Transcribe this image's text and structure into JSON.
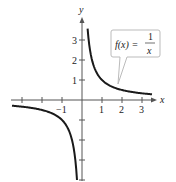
{
  "chart_data": {
    "type": "line",
    "title": "",
    "function_label": {
      "lhs": "f(x) =",
      "num": "1",
      "den": "x"
    },
    "xlabel": "x",
    "ylabel": "y",
    "xlim": [
      -3.5,
      3.5
    ],
    "ylim": [
      -4,
      3.6
    ],
    "x_ticks": [
      -3,
      -2,
      -1,
      1,
      2,
      3
    ],
    "x_tick_labels": [
      "",
      "",
      "-1",
      "1",
      "2",
      "3"
    ],
    "y_ticks": [
      -4,
      -3,
      -2,
      -1,
      1,
      2,
      3
    ],
    "y_tick_labels": [
      "",
      "",
      "",
      "",
      "1",
      "2",
      "3"
    ],
    "grid": false,
    "series": [
      {
        "name": "f(x) = 1/x (x>0)",
        "x": [
          0.28,
          0.5,
          1,
          2,
          3,
          3.5
        ],
        "y": [
          3.57,
          2,
          1,
          0.5,
          0.333,
          0.286
        ]
      },
      {
        "name": "f(x) = 1/x (x<0)",
        "x": [
          -3.5,
          -3,
          -2,
          -1,
          -0.5,
          -0.25
        ],
        "y": [
          -0.286,
          -0.333,
          -0.5,
          -1,
          -2,
          -4
        ]
      }
    ],
    "colors": {
      "curve": "#1a1a1a",
      "axis": "#555555",
      "callout_border": "#bbbbbb"
    }
  }
}
